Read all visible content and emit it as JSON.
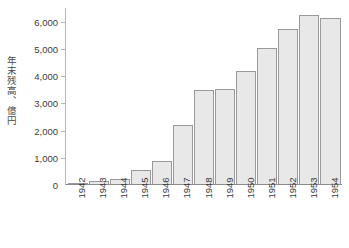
{
  "chart_data": {
    "type": "bar",
    "title": "",
    "xlabel": "",
    "ylabel": "年末残高、億円",
    "categories": [
      "1942",
      "1943",
      "1944",
      "1945",
      "1946",
      "1947",
      "1948",
      "1949",
      "1950",
      "1951",
      "1952",
      "1953",
      "1954"
    ],
    "values": [
      50,
      100,
      180,
      500,
      850,
      2150,
      3450,
      3480,
      4150,
      5000,
      5700,
      6200,
      6100
    ],
    "ylim": [
      0,
      6500
    ],
    "yticks": [
      0,
      1000,
      2000,
      3000,
      4000,
      5000,
      6000
    ],
    "ytick_labels": [
      "0",
      "1,000",
      "2,000",
      "3,000",
      "4,000",
      "5,000",
      "6,000"
    ],
    "grid": false,
    "legend": "none",
    "bar_fill_color": "#e8e8e8",
    "bar_border_color": "#9a9a9a",
    "axis_color": "#8c8c8c"
  },
  "caption": ""
}
